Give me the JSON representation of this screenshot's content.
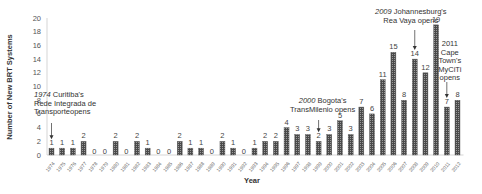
{
  "chart_data": {
    "type": "bar",
    "title": "",
    "xlabel": "Year",
    "ylabel": "Number of New BRT Systems",
    "ylim": [
      0,
      20
    ],
    "yticks": [
      0,
      2,
      4,
      6,
      8,
      10,
      12,
      14,
      16,
      18,
      20
    ],
    "grid": false,
    "legend": null,
    "categories": [
      "1974",
      "1975",
      "1976",
      "1977",
      "1978",
      "1979",
      "1980",
      "1981",
      "1982",
      "1983",
      "1984",
      "1985",
      "1986",
      "1987",
      "1988",
      "1989",
      "1990",
      "1991",
      "1992",
      "1993",
      "1994",
      "1995",
      "1996",
      "1997",
      "1998",
      "1999",
      "2000",
      "2001",
      "2002",
      "2003",
      "2004",
      "2005",
      "2006",
      "2007",
      "2008",
      "2009",
      "2010",
      "2011",
      "2012"
    ],
    "values": [
      1,
      1,
      1,
      2,
      0,
      0,
      2,
      0,
      2,
      1,
      0,
      0,
      2,
      1,
      1,
      0,
      2,
      1,
      0,
      1,
      2,
      2,
      4,
      3,
      3,
      2,
      3,
      5,
      3,
      7,
      6,
      11,
      15,
      8,
      14,
      12,
      19,
      7,
      8
    ],
    "data_labels": true,
    "bar_color": "#5a5a5a",
    "annotations": [
      {
        "category": "1974",
        "year_text": "1974",
        "lines": [
          "Curitiba's",
          "Rede Integrada de",
          "Transporteopens"
        ]
      },
      {
        "category": "1999",
        "year_text": "2000",
        "lines": [
          "Bogota's",
          "TransMilenio opens"
        ]
      },
      {
        "category": "2008",
        "year_text": "2009",
        "lines": [
          "Johannesburg's",
          "Rea Vaya opens"
        ]
      },
      {
        "category": "2011",
        "year_text": "2011",
        "lines": [
          "Cape",
          "Town's",
          "MyCiTi",
          "opens"
        ]
      }
    ]
  }
}
